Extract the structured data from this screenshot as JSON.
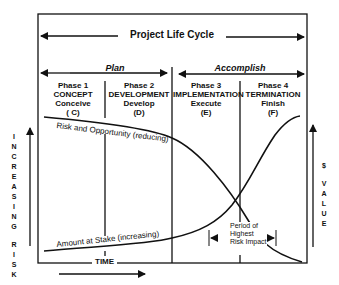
{
  "title": "Project Life Cycle",
  "stages": [
    {
      "label": "Plan"
    },
    {
      "label": "Accomplish"
    }
  ],
  "phases": [
    {
      "number": "Phase 1",
      "name": "CONCEPT",
      "verb": "Conceive",
      "code": "( C)"
    },
    {
      "number": "Phase 2",
      "name": "DEVELOPMENT",
      "verb": "Develop",
      "code": "(D)"
    },
    {
      "number": "Phase 3",
      "name": "IMPLEMENTATION",
      "verb": "Execute",
      "code": "(E)"
    },
    {
      "number": "Phase 4",
      "name": "TERMINATION",
      "verb": "Finish",
      "code": "(F)"
    }
  ],
  "curves": {
    "risk": "Risk and Opportunity (reducing)",
    "stake": "Amount at Stake (increasing)"
  },
  "left_axis": "INCREASING RISK",
  "right_axis": "$ VALUE",
  "time_label": "TIME",
  "annotation": {
    "line1": "Period of",
    "line2": "Highest",
    "line3": "Risk Impact"
  },
  "colors": {
    "line": "#111111",
    "background": "#ffffff"
  }
}
